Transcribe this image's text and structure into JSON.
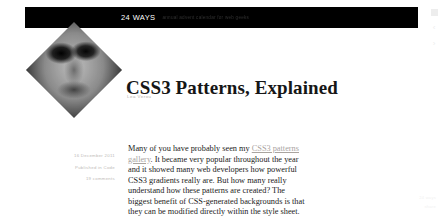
{
  "header": {
    "logo": "24 WAYS",
    "tagline": "annual advent calendar for web geeks"
  },
  "article": {
    "title": "CSS3 Patterns, Explained",
    "byline": "Lea Verou",
    "meta": {
      "date": "16 December 2011",
      "category": "Published in Code",
      "comments": "19 comments"
    },
    "body": {
      "part1": "Many of you have probably seen my ",
      "link": "CSS3 patterns gallery",
      "part2": ". It became very popular throughout the year and it showed many web developers how powerful CSS3 gradients really are. But how many really understand how these patterns are created? The biggest benefit of CSS‑generated backgrounds is that they can be modified directly within the style sheet. This benefit is void if we are just copying and"
    }
  },
  "viewport_controls": {
    "panel": "panel-icon",
    "prev": "chevron-left-icon",
    "next": "chevron-right-icon"
  },
  "footer_marks": {
    "line1": "24 ways",
    "line2": "share"
  },
  "colors": {
    "header_bg": "#000000",
    "text": "#1b1b1b",
    "muted": "#bdbab6",
    "link": "#a9a49f"
  }
}
